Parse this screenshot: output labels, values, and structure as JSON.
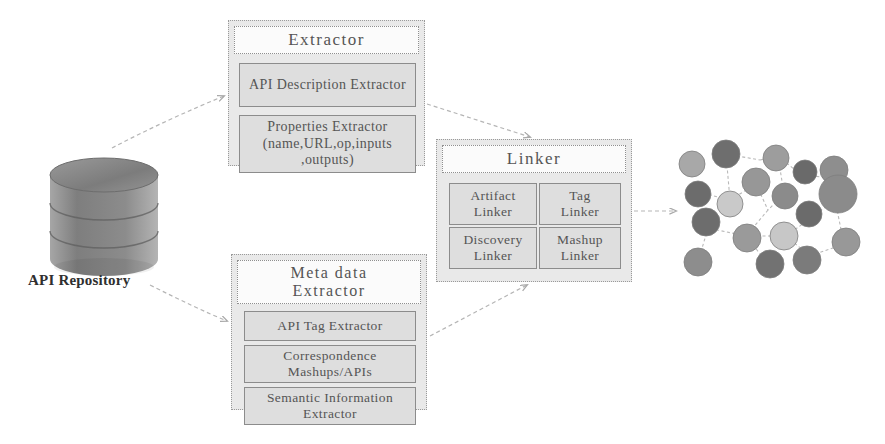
{
  "diagram": {
    "background": "#ffffff",
    "palette": {
      "panel_fill": "#e9e9e9",
      "panel_border": "#9a9a9a",
      "title_fill": "#fbfbfb",
      "sub_box_fill": "#dedede",
      "sub_box_border": "#8c8c8c",
      "text": "#555555",
      "connector": "#b0b0b0",
      "node_dark": "#6e6e6e",
      "node_mid": "#8f8f8f",
      "node_light": "#c9c9c9"
    }
  },
  "repository": {
    "name": "api-repository",
    "label": "API Repository",
    "shape": "cylinder",
    "bands": 3
  },
  "modules": [
    {
      "id": "extractor",
      "title": "Extractor",
      "items": [
        {
          "id": "api-description-extractor",
          "label": "API Description Extractor"
        },
        {
          "id": "properties-extractor",
          "label": "Properties Extractor (name,URL,op,inputs ,outputs)"
        }
      ]
    },
    {
      "id": "linker",
      "title": "Linker",
      "items": [
        {
          "id": "artifact-linker",
          "label": "Artifact Linker"
        },
        {
          "id": "tag-linker",
          "label": "Tag Linker"
        },
        {
          "id": "discovery-linker",
          "label": "Discovery Linker"
        },
        {
          "id": "mashup-linker",
          "label": "Mashup Linker"
        }
      ]
    },
    {
      "id": "metadata-extractor",
      "title_line1": "Meta data",
      "title_line2": "Extractor",
      "items": [
        {
          "id": "api-tag-extractor",
          "label": "API Tag Extractor"
        },
        {
          "id": "correspondence-mashups-apis",
          "label": "Correspondence Mashups/APIs"
        },
        {
          "id": "semantic-information-extractor",
          "label": "Semantic Information Extractor"
        }
      ]
    }
  ],
  "extractor": {
    "title": "Extractor",
    "api_description": "API Description Extractor",
    "properties_line1": "Properties Extractor",
    "properties_line2": "(name,URL,op,inputs",
    "properties_line3": ",outputs)"
  },
  "linker": {
    "title": "Linker",
    "artifact_line1": "Artifact",
    "artifact_line2": "Linker",
    "tag_line1": "Tag",
    "tag_line2": "Linker",
    "discovery_line1": "Discovery",
    "discovery_line2": "Linker",
    "mashup_line1": "Mashup",
    "mashup_line2": "Linker"
  },
  "metadata": {
    "title_line1": "Meta data",
    "title_line2": "Extractor",
    "api_tag": "API Tag Extractor",
    "correspondence_line1": "Correspondence",
    "correspondence_line2": "Mashups/APIs",
    "semantic_line1": "Semantic Information",
    "semantic_line2": "Extractor"
  },
  "connectors": [
    {
      "id": "repo-to-extractor",
      "from": "api-repository",
      "to": "extractor",
      "style": "dashed",
      "arrow": true
    },
    {
      "id": "repo-to-metadata",
      "from": "api-repository",
      "to": "metadata-extractor",
      "style": "dashed",
      "arrow": true
    },
    {
      "id": "extractor-to-linker",
      "from": "extractor",
      "to": "linker",
      "style": "dashed",
      "arrow": true
    },
    {
      "id": "metadata-to-linker",
      "from": "metadata-extractor",
      "to": "linker",
      "style": "dashed",
      "arrow": true
    },
    {
      "id": "linker-to-graph",
      "from": "linker",
      "to": "network-graph",
      "style": "dashed",
      "arrow": true
    }
  ],
  "network_graph": {
    "id": "network-graph",
    "node_count": 18,
    "description": "linked service network of shaded circular nodes connected by dashed edges"
  }
}
